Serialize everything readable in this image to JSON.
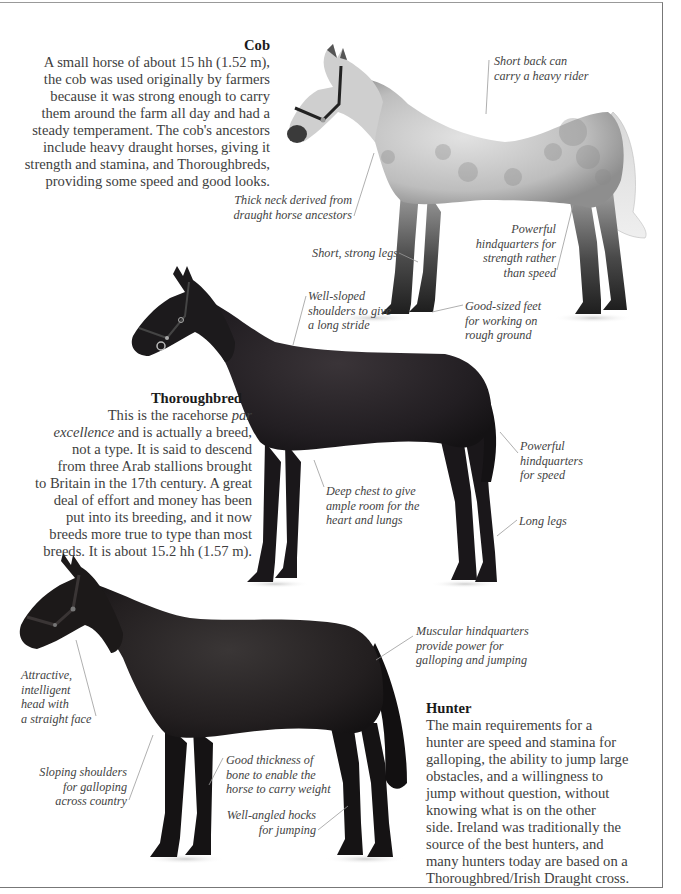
{
  "sections": {
    "cob": {
      "title": "Cob",
      "lines": [
        "A small horse of about 15 hh (1.52 m),",
        "the cob was used originally by farmers",
        "because it was strong enough to carry",
        "them around the farm all day and had a",
        "steady temperament. The cob's ancestors",
        "include heavy draught horses, giving it",
        "strength and stamina, and Thoroughbreds,",
        "providing some speed and good looks."
      ],
      "captions": {
        "back": [
          "Short back can",
          "carry a heavy rider"
        ],
        "neck": [
          "Thick neck derived from",
          "draught horse ancestors"
        ],
        "legs": [
          "Short, strong legs"
        ],
        "hindquarters": [
          "Powerful",
          "hindquarters for",
          "strength rather",
          "than speed"
        ],
        "feet": [
          "Good-sized feet",
          "for working on",
          "rough ground"
        ]
      }
    },
    "thoroughbred": {
      "title": "Thoroughbred",
      "line1_prefix": "This is the racehorse ",
      "line1_italic": "par",
      "line2_italic": "excellence",
      "line2_suffix": " and is actually a breed,",
      "lines": [
        "not a type. It is said to descend",
        "from three Arab stallions brought",
        "to Britain in the 17th century. A great",
        "deal of effort and money has been",
        "put into its breeding, and it now",
        "breeds more true to type than most",
        "breeds. It is about 15.2 hh (1.57 m)."
      ],
      "captions": {
        "shoulders": [
          "Well-sloped",
          "shoulders to give",
          "a long stride"
        ],
        "hindquarters": [
          "Powerful",
          "hindquarters",
          "for speed"
        ],
        "chest": [
          "Deep chest to give",
          "ample room for the",
          "heart and lungs"
        ],
        "legs": [
          "Long legs"
        ]
      }
    },
    "hunter": {
      "title": "Hunter",
      "lines": [
        "The main requirements for a",
        "hunter are speed and stamina for",
        "galloping, the ability to jump large",
        "obstacles, and a willingness to",
        "jump without question, without",
        "knowing what is on the other",
        "side. Ireland was traditionally the",
        "source of the best hunters, and",
        "many hunters today are based on a",
        "Thoroughbred/Irish Draught cross."
      ],
      "captions": {
        "hindquarters": [
          "Muscular hindquarters",
          "provide power for",
          "galloping and jumping"
        ],
        "head": [
          "Attractive,",
          "intelligent",
          "head with",
          "a straight face"
        ],
        "shoulders": [
          "Sloping shoulders",
          "for galloping",
          "across country"
        ],
        "bone": [
          "Good thickness of",
          "bone to enable the",
          "horse to carry weight"
        ],
        "hocks": [
          "Well-angled hocks",
          "for jumping"
        ]
      }
    }
  },
  "colors": {
    "cob_coat": "#b9b9b9",
    "cob_dapple": "#8a8a8a",
    "dark_coat": "#1c1a1c",
    "leader_line": "#9a9a9a",
    "text": "#3e3e3e"
  }
}
